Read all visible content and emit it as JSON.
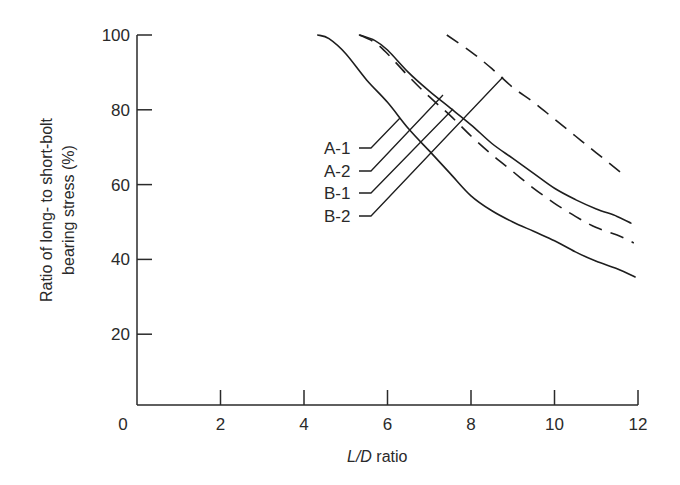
{
  "chart_data": {
    "type": "line",
    "title": "",
    "xlabel": "L/D ratio",
    "xlabel_italic_part": "L/D",
    "xlabel_plain_part": " ratio",
    "ylabel": "Ratio of long- to short-bolt bearing stress (%)",
    "ylabel_lines": [
      "Ratio of long- to short-bolt",
      "bearing stress (%)"
    ],
    "xlim": [
      0,
      12
    ],
    "ylim": [
      0,
      100
    ],
    "x_ticks": [
      0,
      2,
      4,
      6,
      8,
      10,
      12
    ],
    "y_ticks": [
      20,
      40,
      60,
      80,
      100
    ],
    "grid": false,
    "legend": "inline labels with leader lines",
    "series": [
      {
        "name": "A-1",
        "style": "solid",
        "x": [
          4.33,
          4.6,
          5.0,
          5.5,
          6.0,
          6.5,
          7.0,
          7.5,
          8.0,
          8.5,
          9.0,
          9.5,
          10.0,
          10.5,
          11.0,
          11.5,
          11.93
        ],
        "y": [
          100,
          99,
          95,
          88,
          82,
          75,
          69,
          63,
          57,
          53,
          50,
          47.5,
          45,
          42,
          39.5,
          37.5,
          35.3
        ]
      },
      {
        "name": "A-2",
        "style": "solid",
        "x": [
          5.33,
          5.7,
          6.0,
          6.5,
          7.0,
          7.5,
          8.0,
          8.5,
          9.0,
          9.5,
          10.0,
          10.5,
          11.0,
          11.5,
          11.83
        ],
        "y": [
          100,
          98.5,
          96,
          90,
          85,
          80.5,
          76,
          71,
          67,
          63,
          59,
          56,
          53.5,
          51.5,
          49.7
        ]
      },
      {
        "name": "B-1",
        "style": "dashed",
        "x": [
          5.33,
          5.7,
          6.0,
          6.5,
          7.0,
          7.5,
          8.0,
          8.5,
          9.0,
          9.5,
          10.0,
          10.5,
          11.0,
          11.5,
          11.9
        ],
        "y": [
          100,
          98,
          95,
          89,
          83.5,
          78.5,
          73,
          68,
          63.5,
          59,
          55,
          51.5,
          48.5,
          46.5,
          44.4
        ]
      },
      {
        "name": "B-2",
        "style": "dashed",
        "x": [
          7.42,
          8.0,
          8.5,
          9.0,
          9.5,
          10.0,
          10.5,
          11.0,
          11.57
        ],
        "y": [
          100,
          95.5,
          91,
          86,
          82,
          77.5,
          73,
          68.5,
          63.4
        ]
      }
    ],
    "annotations": [
      {
        "text": "A-1",
        "label_pos": [
          324,
          148
        ],
        "leader": [
          [
            359,
            148
          ],
          [
            371,
            148
          ],
          [
            400,
            118
          ]
        ]
      },
      {
        "text": "A-2",
        "label_pos": [
          324,
          171
        ],
        "leader": [
          [
            359,
            171
          ],
          [
            371,
            171
          ],
          [
            443,
            95
          ]
        ]
      },
      {
        "text": "B-1",
        "label_pos": [
          324,
          193
        ],
        "leader": [
          [
            359,
            193
          ],
          [
            371,
            193
          ],
          [
            453,
            109
          ]
        ]
      },
      {
        "text": "B-2",
        "label_pos": [
          324,
          216
        ],
        "leader": [
          [
            359,
            216
          ],
          [
            371,
            216
          ],
          [
            503,
            77
          ]
        ]
      }
    ]
  },
  "colors": {
    "ink": "#1e1e1e",
    "background": "#ffffff"
  }
}
